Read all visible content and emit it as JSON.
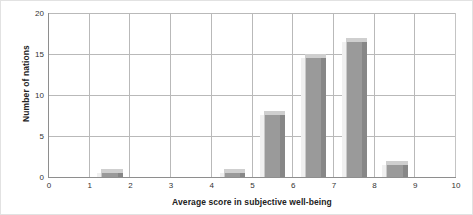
{
  "chart_data": {
    "type": "bar",
    "title": "",
    "subtitle": "",
    "xlabel": "Average score in subjective well-being",
    "ylabel": "Number of nations",
    "xlim": [
      0,
      10
    ],
    "ylim": [
      0,
      20
    ],
    "grid": true,
    "legend": "none",
    "xticks": [
      "0",
      "1",
      "2",
      "3",
      "4",
      "5",
      "6",
      "7",
      "8",
      "9",
      "10"
    ],
    "yticks": [
      "0",
      "5",
      "10",
      "15",
      "20"
    ],
    "bin_width": 1,
    "categories": [
      "0-1",
      "1-2",
      "2-3",
      "3-4",
      "4-5",
      "5-6",
      "6-7",
      "7-8",
      "8-9",
      "9-10"
    ],
    "bins": [
      {
        "start": 0,
        "end": 1,
        "value": 0
      },
      {
        "start": 1,
        "end": 2,
        "value": 1
      },
      {
        "start": 2,
        "end": 3,
        "value": 0
      },
      {
        "start": 3,
        "end": 4,
        "value": 0
      },
      {
        "start": 4,
        "end": 5,
        "value": 1
      },
      {
        "start": 5,
        "end": 6,
        "value": 8
      },
      {
        "start": 6,
        "end": 7,
        "value": 15
      },
      {
        "start": 7,
        "end": 8,
        "value": 17
      },
      {
        "start": 8,
        "end": 9,
        "value": 2
      },
      {
        "start": 9,
        "end": 10,
        "value": 0
      }
    ],
    "values": [
      0,
      1,
      0,
      0,
      1,
      8,
      15,
      17,
      2,
      0
    ],
    "colors": {
      "bar_face": "#9a9a9a",
      "bar_side": "#878787",
      "bar_top": "#cfcfcf",
      "gridline": "#b9b9b9",
      "axis": "#8e8e8e",
      "text": "#222222"
    }
  }
}
